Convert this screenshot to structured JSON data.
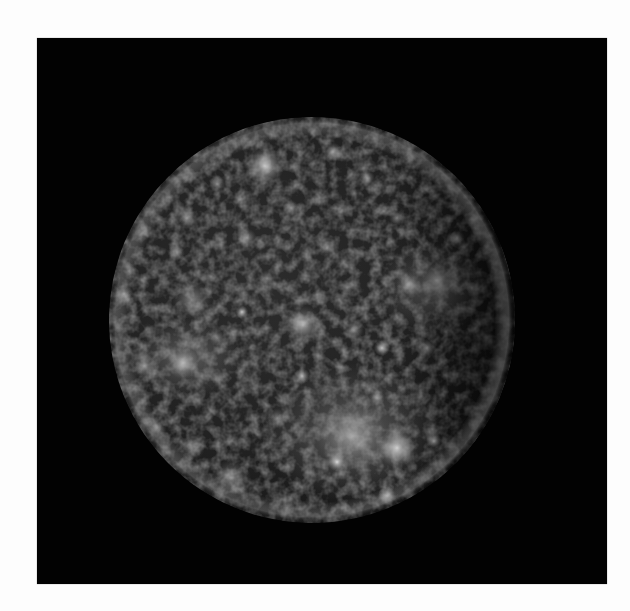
{
  "image": {
    "subject": "Cratered moon (Callisto) photographed against black space",
    "background_color": "#ffffff",
    "frame_color": "#020202",
    "frame": {
      "x": 37,
      "y": 38,
      "width": 570,
      "height": 546
    }
  },
  "moon": {
    "cx": 275,
    "cy": 282,
    "r": 203,
    "surface_dark": "#0d0d0d",
    "surface_mid": "#3a3a3a",
    "limb_light": "#7a7a7a",
    "craters": [
      {
        "x": 228,
        "y": 128,
        "r": 12,
        "o": 0.75
      },
      {
        "x": 296,
        "y": 114,
        "r": 6,
        "o": 0.55
      },
      {
        "x": 180,
        "y": 146,
        "r": 5,
        "o": 0.5
      },
      {
        "x": 150,
        "y": 180,
        "r": 6,
        "o": 0.55
      },
      {
        "x": 330,
        "y": 140,
        "r": 5,
        "o": 0.5
      },
      {
        "x": 254,
        "y": 170,
        "r": 5,
        "o": 0.5
      },
      {
        "x": 210,
        "y": 200,
        "r": 6,
        "o": 0.5
      },
      {
        "x": 290,
        "y": 210,
        "r": 5,
        "o": 0.45
      },
      {
        "x": 360,
        "y": 180,
        "r": 5,
        "o": 0.45
      },
      {
        "x": 420,
        "y": 200,
        "r": 5,
        "o": 0.45
      },
      {
        "x": 400,
        "y": 242,
        "r": 10,
        "o": 0.5
      },
      {
        "x": 372,
        "y": 246,
        "r": 8,
        "o": 0.45
      },
      {
        "x": 266,
        "y": 287,
        "r": 12,
        "o": 0.6
      },
      {
        "x": 205,
        "y": 274,
        "r": 4,
        "o": 0.75
      },
      {
        "x": 155,
        "y": 262,
        "r": 12,
        "o": 0.45
      },
      {
        "x": 345,
        "y": 310,
        "r": 5,
        "o": 0.75
      },
      {
        "x": 317,
        "y": 292,
        "r": 6,
        "o": 0.5
      },
      {
        "x": 390,
        "y": 310,
        "r": 6,
        "o": 0.5
      },
      {
        "x": 146,
        "y": 325,
        "r": 10,
        "o": 0.6
      },
      {
        "x": 107,
        "y": 328,
        "r": 8,
        "o": 0.5
      },
      {
        "x": 87,
        "y": 256,
        "r": 6,
        "o": 0.45
      },
      {
        "x": 265,
        "y": 338,
        "r": 5,
        "o": 0.7
      },
      {
        "x": 315,
        "y": 398,
        "r": 22,
        "o": 0.45
      },
      {
        "x": 360,
        "y": 410,
        "r": 12,
        "o": 0.85
      },
      {
        "x": 300,
        "y": 424,
        "r": 6,
        "o": 0.85
      },
      {
        "x": 397,
        "y": 403,
        "r": 5,
        "o": 0.7
      },
      {
        "x": 450,
        "y": 300,
        "r": 5,
        "o": 0.4
      },
      {
        "x": 195,
        "y": 440,
        "r": 12,
        "o": 0.45
      },
      {
        "x": 155,
        "y": 410,
        "r": 8,
        "o": 0.4
      },
      {
        "x": 350,
        "y": 458,
        "r": 6,
        "o": 0.55
      },
      {
        "x": 120,
        "y": 390,
        "r": 6,
        "o": 0.4
      },
      {
        "x": 240,
        "y": 380,
        "r": 6,
        "o": 0.4
      },
      {
        "x": 460,
        "y": 360,
        "r": 5,
        "o": 0.4
      },
      {
        "x": 340,
        "y": 360,
        "r": 5,
        "o": 0.45
      },
      {
        "x": 140,
        "y": 215,
        "r": 5,
        "o": 0.45
      },
      {
        "x": 310,
        "y": 250,
        "r": 5,
        "o": 0.4
      },
      {
        "x": 230,
        "y": 240,
        "r": 5,
        "o": 0.4
      },
      {
        "x": 435,
        "y": 250,
        "r": 4,
        "o": 0.4
      },
      {
        "x": 180,
        "y": 300,
        "r": 5,
        "o": 0.4
      },
      {
        "x": 250,
        "y": 470,
        "r": 5,
        "o": 0.4
      }
    ]
  }
}
